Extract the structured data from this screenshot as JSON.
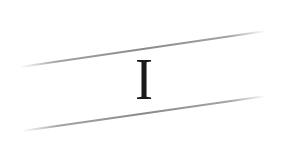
{
  "image": {
    "width": 287,
    "height": 142,
    "background": "#ffffff"
  },
  "text": {
    "glyph": "I",
    "color": "#1a1a1a"
  },
  "lines": [
    {
      "name": "upper-slanted-line",
      "x1": 20,
      "y1": 67,
      "x2": 266,
      "y2": 31,
      "color": "#9a9a9a"
    },
    {
      "name": "lower-slanted-line",
      "x1": 22,
      "y1": 131,
      "x2": 266,
      "y2": 96,
      "color": "#9a9a9a"
    }
  ]
}
